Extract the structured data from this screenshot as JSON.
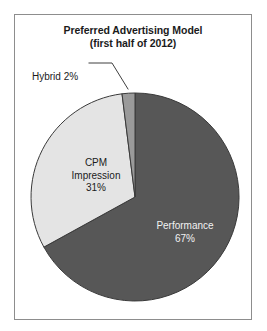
{
  "figure": {
    "border_color": "#8d8d8d",
    "background_color": "#ffffff"
  },
  "title": {
    "main": "Preferred Advertising Model",
    "subtitle": "(first half of 2012)"
  },
  "chart_data": {
    "type": "pie",
    "title": "Preferred Advertising Model",
    "subtitle": "(first half of 2012)",
    "xlabel": "",
    "ylabel": "",
    "units": "percent",
    "start_angle_deg": 0,
    "direction": "clockwise",
    "categories": [
      "Performance",
      "CPM Impression",
      "Hybrid"
    ],
    "values": [
      67,
      31,
      2
    ],
    "colors": [
      "#575757",
      "#e4e4e4",
      "#9a9a9a"
    ],
    "slice_border_color": "#3a3a3a",
    "legend": "none",
    "grid": false,
    "slices": [
      {
        "name": "Performance",
        "value": 67,
        "value_label": "67%",
        "color": "#575757",
        "label_text_color": "#f2f2f2",
        "label_placement": "inside",
        "label_lines": [
          "Performance",
          "67%"
        ]
      },
      {
        "name": "CPM Impression",
        "value": 31,
        "value_label": "31%",
        "color": "#e4e4e4",
        "label_text_color": "#1b1b1b",
        "label_placement": "inside",
        "label_lines": [
          "CPM",
          "Impression",
          "31%"
        ]
      },
      {
        "name": "Hybrid",
        "value": 2,
        "value_label": "2%",
        "color": "#9a9a9a",
        "label_text_color": "#1b1b1b",
        "label_placement": "outside-with-leader",
        "label_lines": [
          "Hybrid 2%"
        ]
      }
    ]
  },
  "labels": {
    "hybrid": {
      "line1": "Hybrid 2%"
    },
    "cpm": {
      "line1": "CPM",
      "line2": "Impression",
      "line3": "31%"
    },
    "performance": {
      "line1": "Performance",
      "line2": "67%"
    }
  }
}
